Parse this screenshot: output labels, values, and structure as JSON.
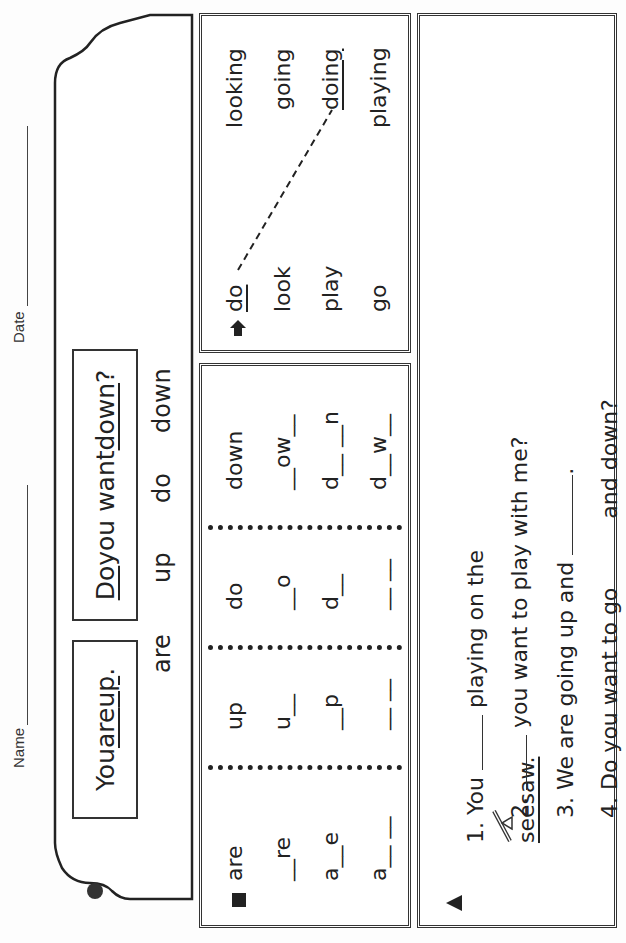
{
  "header": {
    "name_label": "Name",
    "date_label": "Date",
    "sentence_1": {
      "pre": "You ",
      "u1": "are",
      "mid": " ",
      "u2": "up",
      "post": "."
    },
    "sentence_2": {
      "u1": "Do",
      "mid": " you want ",
      "u2": "down",
      "post": "?"
    },
    "word_bank": [
      "are",
      "up",
      "do",
      "down"
    ]
  },
  "spelling_box": {
    "bullet_icon": "square-bullet",
    "columns": [
      {
        "word": "are",
        "rows": [
          "__re",
          "a__e",
          "a__ __"
        ]
      },
      {
        "word": "up",
        "rows": [
          "u__",
          "__p",
          "__ __"
        ]
      },
      {
        "word": "do",
        "rows": [
          "__o",
          "d__",
          "__ __"
        ]
      },
      {
        "word": "down",
        "rows": [
          "__ow__",
          "d__ __n",
          "d__w__"
        ]
      }
    ]
  },
  "matching_box": {
    "bullet_icon": "arrow-up-bullet",
    "left": [
      "do",
      "look",
      "play",
      "go"
    ],
    "right": [
      "looking",
      "going",
      "doing",
      "playing"
    ],
    "example_match": {
      "from": "do",
      "to": "doing"
    }
  },
  "sentences_box": {
    "bullet_icon": "triangle-bullet",
    "items": [
      {
        "num": "1.",
        "parts": [
          "You ",
          "___",
          " playing on the ",
          "[seesaw-icon]",
          " seesaw."
        ]
      },
      {
        "num": "2.",
        "parts": [
          "___",
          " you want to play with me?"
        ]
      },
      {
        "num": "3.",
        "parts": [
          "We are going up and ",
          "___",
          "."
        ]
      },
      {
        "num": "4.",
        "parts": [
          "Do you want to go ",
          "___",
          " and down?"
        ]
      }
    ],
    "s1_pre": "You",
    "s1_mid": "playing on the",
    "s1_end": "seesaw.",
    "s2_post": "you want to play with me?",
    "s3_pre": "We are going up and",
    "s3_post": ".",
    "s4_pre": "Do you want to go",
    "s4_post": "and down?"
  }
}
